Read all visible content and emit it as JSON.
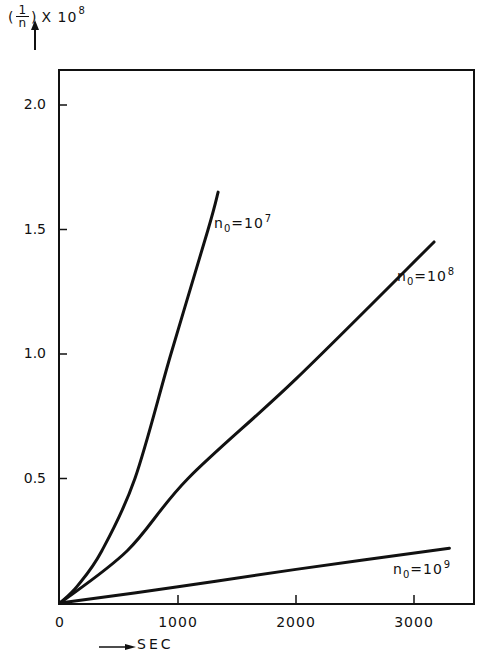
{
  "chart_data": {
    "type": "line",
    "title": "",
    "ylabel": "(1/n) x 10^8",
    "ylabel_parts": {
      "open": "(",
      "num": "1",
      "den": "n",
      "close": ")",
      "mult": "X 10",
      "exp": "8"
    },
    "xlabel": "SEC",
    "xlim": [
      0,
      3500
    ],
    "ylim": [
      0,
      2.2
    ],
    "grid": false,
    "legend": "none (inline curve labels)",
    "x_ticks": [
      0,
      1000,
      2000,
      3000
    ],
    "x_tick_labels": [
      "0",
      "1000",
      "2000",
      "3000"
    ],
    "y_ticks": [
      0.5,
      1.0,
      1.5,
      2.0
    ],
    "y_tick_labels": [
      "0.5",
      "1.0",
      "1.5",
      "2.0"
    ],
    "series": [
      {
        "name": "n0=10^7",
        "label_base": "n",
        "label_sub": "0",
        "label_mid": "=10",
        "label_exp": "7",
        "x": [
          0,
          150,
          355,
          635,
          940,
          1255,
          1340
        ],
        "y": [
          0,
          0.07,
          0.21,
          0.5,
          1.0,
          1.5,
          1.65
        ]
      },
      {
        "name": "n0=10^8",
        "label_base": "n",
        "label_sub": "0",
        "label_mid": "=10",
        "label_exp": "8",
        "x": [
          0,
          570,
          1085,
          2000,
          3170
        ],
        "y": [
          0,
          0.21,
          0.5,
          0.9,
          1.45
        ]
      },
      {
        "name": "n0=10^9",
        "label_base": "n",
        "label_sub": "0",
        "label_mid": "=10",
        "label_exp": "9",
        "x": [
          0,
          1000,
          2000,
          3300
        ],
        "y": [
          0,
          0.065,
          0.135,
          0.22
        ]
      }
    ]
  }
}
